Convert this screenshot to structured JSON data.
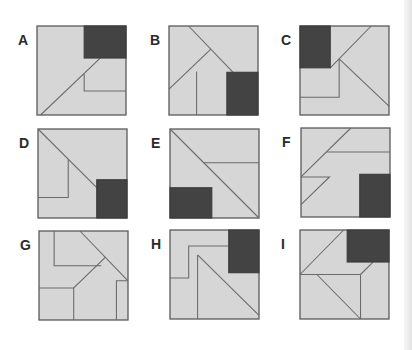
{
  "puzzle": {
    "panels": [
      {
        "label": "A",
        "left": 18,
        "top": 26,
        "dark": {
          "x": 53,
          "y": 0,
          "w": 47,
          "h": 36
        },
        "lines": [
          "4,100 71,36",
          "53,54 53,73 100,73"
        ]
      },
      {
        "label": "B",
        "left": 150,
        "top": 26,
        "dark": {
          "x": 65,
          "y": 52,
          "w": 35,
          "h": 48
        },
        "lines": [
          "22,0 72,52",
          "47,26 0,71",
          "31,51 31,100"
        ]
      },
      {
        "label": "C",
        "left": 281,
        "top": 26,
        "dark": {
          "x": 0,
          "y": 0,
          "w": 34,
          "h": 47
        },
        "lines": [
          "34,47 80,0",
          "44,37 100,90",
          "44,37 44,80 0,80"
        ]
      },
      {
        "label": "D",
        "left": 19,
        "top": 129,
        "dark": {
          "x": 66,
          "y": 57,
          "w": 34,
          "h": 43
        },
        "lines": [
          "0,0 66,66",
          "34,34 34,77 0,77"
        ]
      },
      {
        "label": "E",
        "left": 151,
        "top": 129,
        "dark": {
          "x": 0,
          "y": 66,
          "w": 47,
          "h": 34
        },
        "lines": [
          "0,0 100,100",
          "38,38 100,38"
        ]
      },
      {
        "label": "F",
        "left": 282,
        "top": 128,
        "dark": {
          "x": 66,
          "y": 52,
          "w": 34,
          "h": 48
        },
        "lines": [
          "56,0 0,55",
          "29,27 100,27",
          "0,55 32,55 0,86"
        ]
      },
      {
        "label": "G",
        "left": 20,
        "top": 231,
        "dark": null,
        "lines": [
          "17,0 17,39 70,39",
          "46,0 100,56",
          "75,29 39,64 0,64",
          "39,64 39,100",
          "100,56 87,56 87,100"
        ]
      },
      {
        "label": "H",
        "left": 151,
        "top": 230,
        "dark": {
          "x": 66,
          "y": 0,
          "w": 34,
          "h": 48
        },
        "lines": [
          "0,54 21,54 21,18 66,18",
          "31,28 100,96",
          "31,28 31,100"
        ]
      },
      {
        "label": "I",
        "left": 281,
        "top": 230,
        "dark": {
          "x": 53,
          "y": 0,
          "w": 47,
          "h": 36
        },
        "lines": [
          "49,0 0,50",
          "0,50 68,50",
          "68,50 82,36",
          "68,50 68,100",
          "19,50 68,100"
        ]
      }
    ]
  },
  "colors": {
    "square_fill": "#d6d6d6",
    "square_border": "#5e5e5e",
    "dark_piece": "#434343",
    "lines": "#6a6a6a"
  }
}
